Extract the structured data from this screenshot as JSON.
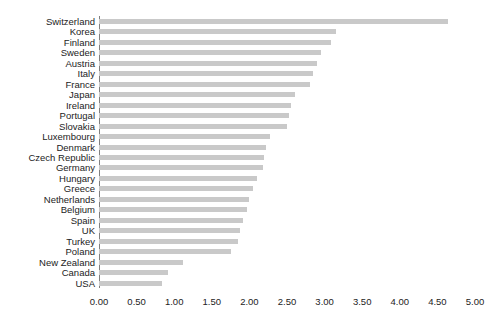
{
  "chart_data": {
    "type": "bar",
    "orientation": "horizontal",
    "title": "",
    "subtitle": "",
    "xlabel": "",
    "ylabel": "",
    "xlim": [
      0.0,
      5.0
    ],
    "xticks": [
      "0.00",
      "0.50",
      "1.00",
      "1.50",
      "2.00",
      "2.50",
      "3.00",
      "3.50",
      "4.00",
      "4.50",
      "5.00"
    ],
    "xtick_values": [
      0.0,
      0.5,
      1.0,
      1.5,
      2.0,
      2.5,
      3.0,
      3.5,
      4.0,
      4.5,
      5.0
    ],
    "grid": false,
    "legend": null,
    "bar_color": "#c9c9c9",
    "axis_color": "#808080",
    "text_color": "#232323",
    "categories": [
      "Switzerland",
      "Korea",
      "Finland",
      "Sweden",
      "Austria",
      "Italy",
      "France",
      "Japan",
      "Ireland",
      "Portugal",
      "Slovakia",
      "Luxembourg",
      "Denmark",
      "Czech Republic",
      "Germany",
      "Hungary",
      "Greece",
      "Netherlands",
      "Belgium",
      "Spain",
      "UK",
      "Turkey",
      "Poland",
      "New Zealand",
      "Canada",
      "USA"
    ],
    "values": [
      4.64,
      3.15,
      3.08,
      2.95,
      2.9,
      2.85,
      2.8,
      2.6,
      2.55,
      2.53,
      2.5,
      2.28,
      2.22,
      2.2,
      2.18,
      2.1,
      2.05,
      2.0,
      1.97,
      1.92,
      1.88,
      1.85,
      1.75,
      1.12,
      0.92,
      0.84
    ]
  }
}
